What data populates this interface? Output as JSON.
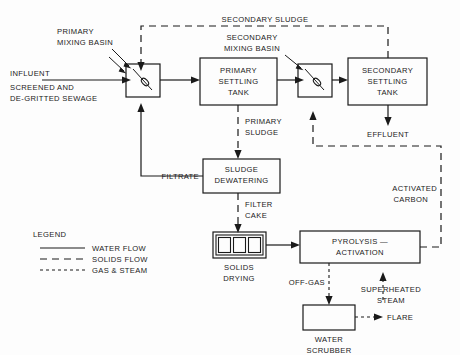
{
  "diagram": {
    "nodes": {
      "primary_mixing_basin": {
        "label": "PRIMARY\nMIXING BASIN",
        "line1": "PRIMARY",
        "line2": "MIXING BASIN"
      },
      "secondary_mixing_basin": {
        "label": "SECONDARY\nMIXING BASIN",
        "line1": "SECONDARY",
        "line2": "MIXING BASIN"
      },
      "primary_settling_tank": {
        "line1": "PRIMARY",
        "line2": "SETTLING",
        "line3": "TANK"
      },
      "secondary_settling_tank": {
        "line1": "SECONDARY",
        "line2": "SETTLING",
        "line3": "TANK"
      },
      "sludge_dewatering": {
        "line1": "SLUDGE",
        "line2": "DEWATERING"
      },
      "solids_drying": {
        "line1": "SOLIDS",
        "line2": "DRYING"
      },
      "pyrolysis_activation": {
        "line1": "PYROLYSIS —",
        "line2": "ACTIVATION"
      },
      "water_scrubber": {
        "line1": "WATER",
        "line2": "SCRUBBER"
      }
    },
    "stream_labels": {
      "influent": "INFLUENT",
      "influent_sub1": "SCREENED AND",
      "influent_sub2": "DE-GRITTED SEWAGE",
      "secondary_sludge": "SECONDARY SLUDGE",
      "primary_sludge_l1": "PRIMARY",
      "primary_sludge_l2": "SLUDGE",
      "effluent": "EFFLUENT",
      "filtrate": "FILTRATE",
      "filter_cake_l1": "FILTER",
      "filter_cake_l2": "CAKE",
      "activated_carbon_l1": "ACTIVATED",
      "activated_carbon_l2": "CARBON",
      "off_gas": "OFF-GAS",
      "superheated_steam_l1": "SUPERHEATED",
      "superheated_steam_l2": "STEAM",
      "flare": "FLARE"
    },
    "legend": {
      "title": "LEGEND",
      "items": [
        {
          "label": "WATER FLOW",
          "style": "solid"
        },
        {
          "label": "SOLIDS FLOW",
          "style": "dashed"
        },
        {
          "label": "GAS & STEAM",
          "style": "dotted"
        }
      ]
    },
    "colors": {
      "ink": "#1a1a1a",
      "background": "#fdfdfd"
    }
  }
}
